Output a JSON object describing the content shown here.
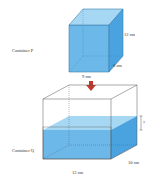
{
  "container_p": {
    "label": "Container P",
    "height": "12 cm",
    "depth": "6 cm",
    "width": "9 cm"
  },
  "arrow": "down-arrow",
  "container_q": {
    "label": "Container Q",
    "water_height": "?",
    "depth": "10 cm",
    "width": "12 cm"
  },
  "colors": {
    "water_front": "#6cb8e8",
    "water_top": "#a6d8f4",
    "water_side": "#4aa3df",
    "arrow": "#c0392b",
    "edge": "#555555"
  }
}
